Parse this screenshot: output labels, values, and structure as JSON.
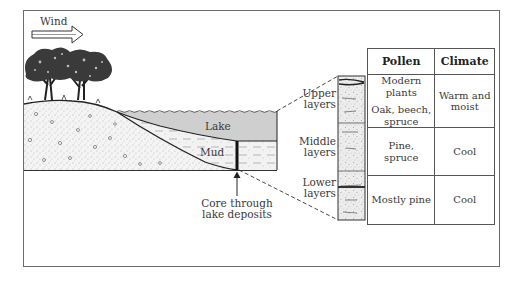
{
  "diagram": {
    "wind_label": "Wind",
    "lake_label": "Lake",
    "mud_label": "Mud",
    "core_label_line1": "Core through",
    "core_label_line2": "lake deposits",
    "layers": [
      {
        "line1": "Upper",
        "line2": "layers"
      },
      {
        "line1": "Middle",
        "line2": "layers"
      },
      {
        "line1": "Lower",
        "line2": "layers"
      }
    ]
  },
  "table": {
    "headers": [
      "Pollen",
      "Climate"
    ],
    "rows": [
      {
        "pollen_line1": "Modern plants",
        "pollen_line2": "Oak, beech,",
        "pollen_line3": "spruce",
        "climate_line1": "Warm and",
        "climate_line2": "moist"
      },
      {
        "pollen": "Pine, spruce",
        "climate": "Cool"
      },
      {
        "pollen": "Mostly pine",
        "climate": "Cool"
      }
    ]
  },
  "colors": {
    "lake_fill": "#cfcfcf",
    "line": "#222222",
    "frame": "#6b6b6b"
  }
}
